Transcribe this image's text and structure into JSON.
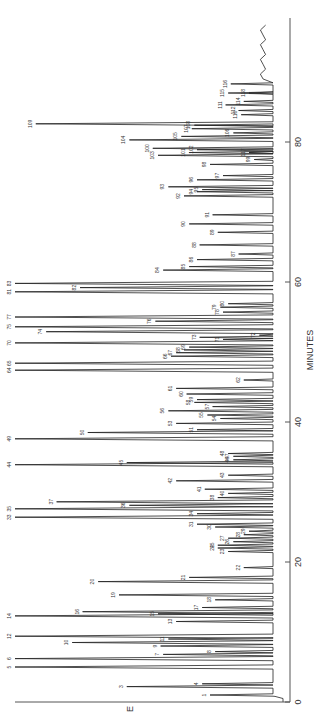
{
  "chart_data": {
    "type": "line",
    "title": "",
    "subtitle": "",
    "orientation": "rotated-90 (time axis vertical on right, signal extends leftward)",
    "xlabel": "MINUTES",
    "ylabel": "E",
    "xlim": [
      0,
      97
    ],
    "x_ticks": [
      0,
      20,
      40,
      60,
      80
    ],
    "x_tick_labels": [
      "0",
      "20",
      "40",
      "60",
      "80"
    ],
    "grid": false,
    "legend": null,
    "peaks": [
      {
        "id": "1",
        "t": 1.0,
        "h": 0.25
      },
      {
        "id": "3",
        "t": 2.2,
        "h": 0.57
      },
      {
        "id": "4",
        "t": 2.6,
        "h": 0.28
      },
      {
        "id": "5",
        "t": 5.0,
        "h": 1.0
      },
      {
        "id": "6",
        "t": 6.2,
        "h": 1.0
      },
      {
        "id": "7",
        "t": 6.8,
        "h": 0.43
      },
      {
        "id": "8",
        "t": 7.2,
        "h": 0.23
      },
      {
        "id": "9",
        "t": 8.0,
        "h": 0.44
      },
      {
        "id": "10",
        "t": 8.5,
        "h": 0.78
      },
      {
        "id": "11",
        "t": 9.0,
        "h": 0.41
      },
      {
        "id": "12",
        "t": 9.4,
        "h": 1.0
      },
      {
        "id": "13",
        "t": 11.5,
        "h": 0.38
      },
      {
        "id": "14",
        "t": 12.3,
        "h": 1.0
      },
      {
        "id": "15",
        "t": 12.6,
        "h": 0.45
      },
      {
        "id": "16",
        "t": 12.9,
        "h": 0.74
      },
      {
        "id": "17",
        "t": 13.5,
        "h": 0.28
      },
      {
        "id": "18",
        "t": 14.6,
        "h": 0.23
      },
      {
        "id": "19",
        "t": 15.3,
        "h": 0.6
      },
      {
        "id": "20",
        "t": 17.2,
        "h": 0.68
      },
      {
        "id": "21",
        "t": 17.8,
        "h": 0.33
      },
      {
        "id": "22",
        "t": 19.2,
        "h": 0.12
      },
      {
        "id": "23",
        "t": 21.5,
        "h": 0.18
      },
      {
        "id": "24",
        "t": 22.0,
        "h": 0.22
      },
      {
        "id": "25",
        "t": 22.4,
        "h": 0.22
      },
      {
        "id": "26",
        "t": 22.9,
        "h": 0.16
      },
      {
        "id": "27",
        "t": 23.4,
        "h": 0.18
      },
      {
        "id": "28",
        "t": 23.9,
        "h": 0.12
      },
      {
        "id": "29",
        "t": 24.4,
        "h": 0.1
      },
      {
        "id": "30",
        "t": 25.0,
        "h": 0.23
      },
      {
        "id": "31",
        "t": 25.4,
        "h": 0.3
      },
      {
        "id": "33",
        "t": 26.4,
        "h": 1.0
      },
      {
        "id": "34",
        "t": 26.9,
        "h": 0.3
      },
      {
        "id": "35",
        "t": 27.6,
        "h": 1.0
      },
      {
        "id": "36",
        "t": 28.1,
        "h": 0.56
      },
      {
        "id": "37",
        "t": 28.6,
        "h": 0.84
      },
      {
        "id": "38",
        "t": 29.2,
        "h": 0.22
      },
      {
        "id": "40",
        "t": 29.8,
        "h": 0.18
      },
      {
        "id": "41",
        "t": 30.4,
        "h": 0.27
      },
      {
        "id": "42",
        "t": 31.6,
        "h": 0.38
      },
      {
        "id": "43",
        "t": 32.4,
        "h": 0.18
      },
      {
        "id": "44",
        "t": 33.9,
        "h": 1.0
      },
      {
        "id": "45",
        "t": 34.2,
        "h": 0.57
      },
      {
        "id": "46",
        "t": 34.6,
        "h": 0.16
      },
      {
        "id": "47",
        "t": 35.1,
        "h": 0.16
      },
      {
        "id": "48",
        "t": 35.5,
        "h": 0.18
      },
      {
        "id": "49",
        "t": 37.6,
        "h": 1.0
      },
      {
        "id": "50",
        "t": 38.5,
        "h": 0.72
      },
      {
        "id": "51",
        "t": 38.9,
        "h": 0.3
      },
      {
        "id": "53",
        "t": 39.8,
        "h": 0.38
      },
      {
        "id": "54",
        "t": 40.5,
        "h": 0.21
      },
      {
        "id": "55",
        "t": 41.0,
        "h": 0.26
      },
      {
        "id": "56",
        "t": 41.6,
        "h": 0.41
      },
      {
        "id": "57",
        "t": 42.2,
        "h": 0.24
      },
      {
        "id": "58",
        "t": 42.8,
        "h": 0.31
      },
      {
        "id": "59",
        "t": 43.2,
        "h": 0.3
      },
      {
        "id": "60",
        "t": 44.0,
        "h": 0.34
      },
      {
        "id": "61",
        "t": 44.8,
        "h": 0.38
      },
      {
        "id": "62",
        "t": 46.0,
        "h": 0.12
      },
      {
        "id": "64",
        "t": 47.4,
        "h": 1.0
      },
      {
        "id": "65",
        "t": 48.4,
        "h": 1.0
      },
      {
        "id": "66",
        "t": 49.4,
        "h": 0.4
      },
      {
        "id": "67",
        "t": 49.9,
        "h": 0.38
      },
      {
        "id": "68",
        "t": 50.3,
        "h": 0.35
      },
      {
        "id": "69",
        "t": 50.7,
        "h": 0.33
      },
      {
        "id": "70",
        "t": 51.3,
        "h": 1.0
      },
      {
        "id": "71",
        "t": 51.8,
        "h": 0.2
      },
      {
        "id": "72",
        "t": 52.4,
        "h": 0.06
      },
      {
        "id": "73",
        "t": 52.1,
        "h": 0.29
      },
      {
        "id": "74",
        "t": 52.9,
        "h": 0.88
      },
      {
        "id": "75",
        "t": 53.6,
        "h": 1.0
      },
      {
        "id": "76",
        "t": 54.4,
        "h": 0.46
      },
      {
        "id": "77",
        "t": 55.0,
        "h": 1.0
      },
      {
        "id": "78",
        "t": 55.7,
        "h": 0.2
      },
      {
        "id": "79",
        "t": 56.4,
        "h": 0.21
      },
      {
        "id": "80",
        "t": 56.9,
        "h": 0.18
      },
      {
        "id": "81",
        "t": 58.6,
        "h": 1.0
      },
      {
        "id": "82",
        "t": 59.2,
        "h": 0.75
      },
      {
        "id": "83",
        "t": 59.8,
        "h": 1.0
      },
      {
        "id": "84",
        "t": 61.7,
        "h": 0.43
      },
      {
        "id": "85",
        "t": 62.2,
        "h": 0.33
      },
      {
        "id": "86",
        "t": 63.2,
        "h": 0.3
      },
      {
        "id": "87",
        "t": 64.0,
        "h": 0.14
      },
      {
        "id": "88",
        "t": 65.3,
        "h": 0.29
      },
      {
        "id": "89",
        "t": 67.1,
        "h": 0.22
      },
      {
        "id": "90",
        "t": 68.3,
        "h": 0.33
      },
      {
        "id": "91",
        "t": 69.6,
        "h": 0.24
      },
      {
        "id": "92",
        "t": 72.3,
        "h": 0.35
      },
      {
        "id": "93",
        "t": 73.6,
        "h": 0.41
      },
      {
        "id": "94",
        "t": 72.9,
        "h": 0.3
      },
      {
        "id": "95",
        "t": 73.2,
        "h": 0.28
      },
      {
        "id": "96",
        "t": 74.6,
        "h": 0.3
      },
      {
        "id": "97",
        "t": 75.2,
        "h": 0.2
      },
      {
        "id": "98",
        "t": 76.8,
        "h": 0.25
      },
      {
        "id": "99",
        "t": 77.5,
        "h": 0.08
      },
      {
        "id": "100",
        "t": 79.1,
        "h": 0.47
      },
      {
        "id": "101",
        "t": 78.5,
        "h": 0.33
      },
      {
        "id": "102",
        "t": 78.9,
        "h": 0.3
      },
      {
        "id": "103",
        "t": 78.1,
        "h": 0.45
      },
      {
        "id": "104",
        "t": 80.3,
        "h": 0.56
      },
      {
        "id": "105",
        "t": 80.8,
        "h": 0.36
      },
      {
        "id": "106",
        "t": 81.3,
        "h": 0.16
      },
      {
        "id": "107",
        "t": 81.9,
        "h": 0.32
      },
      {
        "id": "108",
        "t": 82.4,
        "h": 0.31
      },
      {
        "id": "109",
        "t": 82.6,
        "h": 0.92
      },
      {
        "id": "110",
        "t": 83.9,
        "h": 0.13
      },
      {
        "id": "111",
        "t": 85.3,
        "h": 0.19
      },
      {
        "id": "112",
        "t": 84.5,
        "h": 0.14
      },
      {
        "id": "114",
        "t": 85.8,
        "h": 0.12
      },
      {
        "id": "115",
        "t": 87.0,
        "h": 0.18
      },
      {
        "id": "116",
        "t": 88.3,
        "h": 0.17
      },
      {
        "id": "117",
        "t": 78.5,
        "h": 0.1
      },
      {
        "id": "118",
        "t": 87.0,
        "h": 0.1
      }
    ],
    "annotations": [
      "peak numbers 1–118 labeled at peak tips"
    ]
  },
  "axis": {
    "time_label": "MINUTES",
    "signal_label": "E",
    "ticks": [
      {
        "value": 0,
        "label": "0"
      },
      {
        "value": 20,
        "label": "20"
      },
      {
        "value": 40,
        "label": "40"
      },
      {
        "value": 60,
        "label": "60"
      },
      {
        "value": 80,
        "label": "80"
      }
    ]
  },
  "colors": {
    "trace": "#222222",
    "axis": "#555555",
    "label": "#333333",
    "background": "#ffffff"
  }
}
